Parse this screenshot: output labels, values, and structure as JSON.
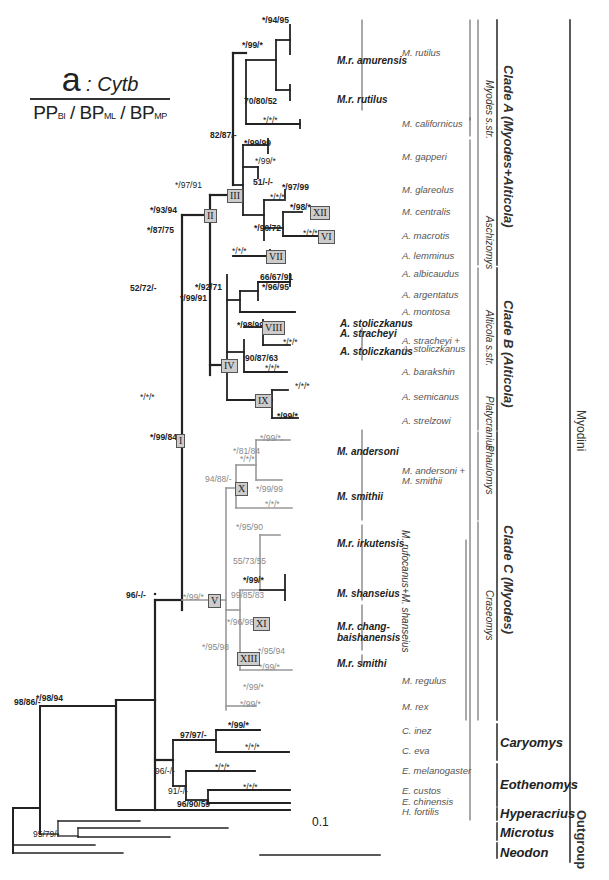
{
  "legend": {
    "panel": "a",
    "gene": "Cytb",
    "support_format": [
      "PP",
      "BI",
      "BP",
      "ML",
      "BP",
      "MP"
    ]
  },
  "scale_bar": "0.1",
  "support_values": {
    "root_a": "98/86/-",
    "myodini": "*/98/94",
    "outgroup_microtus": "95/79/-",
    "caryomys_eoth": "96/-/-",
    "caryomys": "97/97/-",
    "c_inez": "*/99/*",
    "c_eva": "*/*/*",
    "eoth_91": "91/-/-",
    "e_melano": "*/*/*",
    "eoth_96": "96/90/59",
    "e_custos": "*/*/*",
    "node_I": "*/99/84",
    "node_II": "*/93/94",
    "node_III": "*/97/91",
    "node_rutilus_cal": "82/87/-",
    "m_rutilus": "*/99/*",
    "amurensis": "*/94/95",
    "rutilus_ss": "70/80/52",
    "californicus": "*/*/*",
    "gapperi_group": "*/99/99",
    "gapperi_sub": "*/99/*",
    "node_51": "51/-/-",
    "glareolus": "*/97/99",
    "glar_cent": "*/*/*",
    "centralis": "*/98/*",
    "node_90_72": "*/90/72",
    "macrotis": "*/*/*",
    "lemminus": "*/*/*",
    "node_IV": "*/87/75",
    "node_52": "52/72/-",
    "alti_ss": "*/99/91",
    "albicaudus_arg": "*/92/71",
    "albicaudus": "66/67/91",
    "arg_sub": "*/96/95",
    "node_VIII": "*/98/99",
    "stol_sub": "*/*/*",
    "node_90_87": "90/87/63",
    "barakshin": "*/*/*",
    "node_IX": "*/*/*",
    "semicanus": "*/*/*",
    "strelzowi": "*/99/*",
    "node_V": "*/99/*",
    "node_X": "94/88/-",
    "anders_group": "*/*/*",
    "anders_81": "*/81/84",
    "anders_sub": "*/99/*",
    "smithii": "*/99/99",
    "smithii2": "*/*/*",
    "irkutensis": "*/95/90",
    "node_55": "55/73/55",
    "shanseius": "*/99/*",
    "node_99_85": "99/85/83",
    "node_XI": "*/96/98",
    "node_XIII": "*/95/98",
    "chang": "*/95/94",
    "smithi": "*/99/*",
    "regulus": "*/99/*",
    "rex": "*/99/*"
  },
  "roman_nodes": [
    "I",
    "II",
    "III",
    "IV",
    "V",
    "VI",
    "VII",
    "VIII",
    "IX",
    "X",
    "XI",
    "XII",
    "XIII"
  ],
  "taxa_labels": {
    "mr_amurensis": "M.r. amurensis",
    "mr_rutilus": "M.r. rutilus",
    "a_stoliczkanus_1": "A. stoliczkanus",
    "a_stracheyi": "A. stracheyi",
    "a_stoliczkanus_2": "A. stoliczkanus",
    "m_andersoni": "M. andersoni",
    "m_smithii": "M. smithii",
    "mr_irkutensis": "M.r. irkutensis",
    "m_shanseius": "M. shanseius",
    "mr_chang": "M.r. chang-",
    "mr_chang2": "baishanensis",
    "mr_smithi": "M.r. smithi"
  },
  "species": [
    {
      "label": "M. rutilus",
      "y": 53
    },
    {
      "label": "M. californicus",
      "y": 124
    },
    {
      "label": "M. gapperi",
      "y": 157
    },
    {
      "label": "M. glareolus",
      "y": 190
    },
    {
      "label": "M. centralis",
      "y": 212
    },
    {
      "label": "A. macrotis",
      "y": 236
    },
    {
      "label": "A. lemminus",
      "y": 256
    },
    {
      "label": "A. albicaudus",
      "y": 274
    },
    {
      "label": "A. argentatus",
      "y": 295
    },
    {
      "label": "A. montosa",
      "y": 312
    },
    {
      "label": "A. stracheyi +",
      "y": 341
    },
    {
      "label": "A. stoliczkanus",
      "y": 349
    },
    {
      "label": "A. barakshin",
      "y": 372
    },
    {
      "label": "A. semicanus",
      "y": 397
    },
    {
      "label": "A. strelzowi",
      "y": 421
    },
    {
      "label": "M. andersoni +",
      "y": 471
    },
    {
      "label": "M. smithii",
      "y": 481
    },
    {
      "label": "M. regulus",
      "y": 681
    },
    {
      "label": "M. rex",
      "y": 707
    },
    {
      "label": "C. inez",
      "y": 731
    },
    {
      "label": "C. eva",
      "y": 751
    },
    {
      "label": "E. melanogaster",
      "y": 771
    },
    {
      "label": "E. custos",
      "y": 791
    },
    {
      "label": "E. chinensis",
      "y": 802
    },
    {
      "label": "H. fortilis",
      "y": 812
    }
  ],
  "subgenera": [
    {
      "label": "Myodes s.str.",
      "x": 482,
      "y1": 20,
      "y2": 265
    },
    {
      "label": "Aschizomys",
      "x": 482,
      "y1": 222,
      "y2": 265
    },
    {
      "label": "Alticola s.str.",
      "x": 482,
      "y1": 270,
      "y2": 395
    },
    {
      "label": "Platycranius",
      "x": 482,
      "y1": 395,
      "y2": 435
    },
    {
      "label": "Phaulomys",
      "x": 482,
      "y1": 435,
      "y2": 520
    },
    {
      "label": "Craseomys",
      "x": 482,
      "y1": 520,
      "y2": 720
    }
  ],
  "rufocanus_label": "M. rufocanus+M. shanseius",
  "clades": {
    "clade_a": "Clade A  (Myodes+Alticola)",
    "clade_b": "Clade B  (Alticola)",
    "clade_c": "Clade C  (Myodes)",
    "caryomys": "Caryomys",
    "eothenomys": "Eothenomys",
    "hyperacrius": "Hyperacrius",
    "microtus": "Microtus",
    "neodon": "Neodon",
    "myodini": "Myodini",
    "outgroup": "Outgroup"
  },
  "accessions": {
    "amurensis": [
      "09NRAP8102",
      "09NRAP999",
      "09NRAP138",
      "09NRAP141",
      "CHBS0824",
      "CHBS018",
      "CHBS027",
      "CHBS021"
    ],
    "rutilus": [
      "AF272637",
      "AY309426",
      "XJ173",
      "XJ167"
    ],
    "californicus": [
      "AY309422",
      "KJ556722"
    ],
    "gapperi": [
      "AF272639",
      "AY309431",
      "AY309430",
      "FJ234423",
      "KJ556782"
    ],
    "glareolus": [
      "AY309421",
      "FJ881475"
    ],
    "centralis": [
      "DQ845185",
      "KJ556625",
      "XJ289"
    ],
    "macrotis": [
      "DQ845195",
      "DQ845196"
    ],
    "lemminus": [
      "AF119273",
      "KJ556633",
      "AY309411"
    ],
    "albicaudus": [
      "KJ556726",
      "KJ556729"
    ],
    "argentatus": [
      "DQ845186",
      "KJ556627"
    ],
    "argentatus2": [
      "KJ556727"
    ],
    "montosa": [
      "KJ556728"
    ],
    "stoliczkanus": [
      "GH082002"
    ],
    "stracheyi": [
      "XZ16119",
      "XZ16N078"
    ],
    "stol2": [
      "XZ16120",
      "XZ16N126",
      "XZ16N121"
    ],
    "barakshin": [
      "KJ556654",
      "KJ556681",
      "KJ556677"
    ],
    "semicanus": [
      "DQ845187",
      "KJ556617",
      "KJ556620"
    ],
    "strelzowi": [
      "DQ845199",
      "KJ556676"
    ],
    "andersoni": [
      "AB037746",
      "AB037298",
      "AB037299",
      "AB037281",
      "AB037302",
      "AB037303"
    ],
    "smithii": [
      "AB037300",
      "KJ556699",
      "AB037312",
      "AB037314"
    ],
    "irkutensis": [
      "09NRAP839",
      "09NRAP048",
      "09NRAP074",
      "09NRAP072",
      "09NRAP064",
      "ybSXJ274",
      "XJ163"
    ],
    "shanseius": [
      "HB10N839",
      "HB10N843",
      "HBN842",
      "SX10N852",
      "SX10N853",
      "SX10N849"
    ],
    "chang": [
      "CHBS0826",
      "CHBS0829",
      "CHBS0031",
      "CHBS0032"
    ],
    "smithi": [
      "AB031961",
      "AY309416"
    ],
    "regulus": [
      "AB037237",
      "DQ138174",
      "NC016427"
    ],
    "rex": [
      "AB505455",
      "AB505458",
      "AB505463"
    ],
    "inez": [
      "HM165385",
      "HM165386"
    ],
    "eva": [
      "HM165401",
      "HM165402"
    ],
    "melanogaster": [
      "HM165399",
      "HM165422"
    ],
    "custos": [
      "HM165408",
      "HM165411"
    ],
    "chinensis": [
      "HM165436"
    ],
    "fortilis": [
      "KJ556725"
    ],
    "microtus": [
      "NC003041",
      "NC008064",
      "NC015243"
    ],
    "neodon": [
      "DQ123686",
      "NC016055"
    ]
  }
}
